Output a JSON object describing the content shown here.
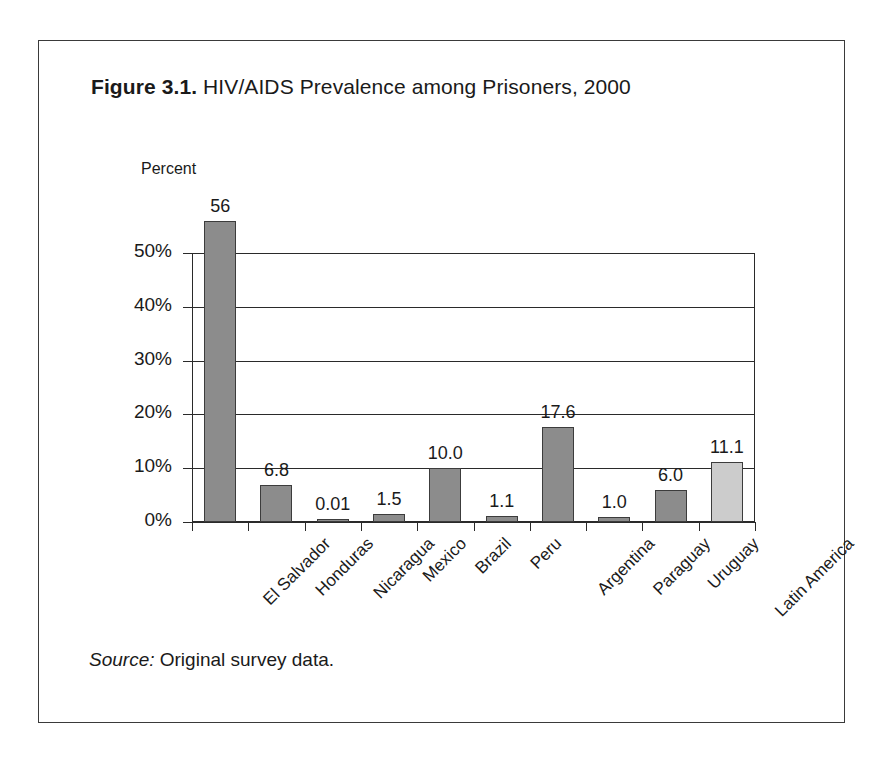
{
  "figure": {
    "number": "Figure 3.1.",
    "title": "HIV/AIDS Prevalence among Prisoners, 2000",
    "source_lead": "Source:",
    "source_text": " Original survey data."
  },
  "chart_data": {
    "type": "bar",
    "title": "HIV/AIDS Prevalence among Prisoners, 2000",
    "xlabel": "",
    "ylabel": "Percent",
    "ylim": [
      0,
      60
    ],
    "grid": true,
    "legend": "none",
    "ytick_labels": [
      "0%",
      "10%",
      "20%",
      "30%",
      "40%",
      "50%"
    ],
    "ytick_values": [
      0,
      10,
      20,
      30,
      40,
      50
    ],
    "categories": [
      "El Salvador",
      "Honduras",
      "Nicaragua",
      "Mexico",
      "Brazil",
      "Peru",
      "Argentina",
      "Paraguay",
      "Uruguay",
      "Latin America"
    ],
    "values": [
      56,
      6.8,
      0.01,
      1.5,
      10.0,
      1.1,
      17.6,
      1.0,
      6.0,
      11.1
    ],
    "value_labels": [
      "56",
      "6.8",
      "0.01",
      "1.5",
      "10.0",
      "1.1",
      "17.6",
      "1.0",
      "6.0",
      "11.1"
    ],
    "bar_colors": [
      "#8c8c8c",
      "#8c8c8c",
      "#8c8c8c",
      "#8c8c8c",
      "#8c8c8c",
      "#8c8c8c",
      "#8c8c8c",
      "#8c8c8c",
      "#8c8c8c",
      "#cccccc"
    ]
  },
  "colors": {
    "bar_fill": "#8c8c8c",
    "bar_fill_highlight": "#cccccc",
    "bar_stroke": "#3c3c3c",
    "axis": "#2a2a2a",
    "rule": "#111111",
    "text": "#1a1a1a",
    "background": "#ffffff"
  }
}
